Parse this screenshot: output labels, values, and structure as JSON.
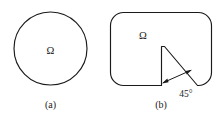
{
  "figure": {
    "background_color": "#ffffff",
    "stroke_color": "#1a1a1a",
    "panels": [
      {
        "id": "a",
        "caption": "(a)",
        "domain_label": "Ω",
        "shape": "circle",
        "description": "smooth circular domain",
        "geometry": {
          "center_x": 50.5,
          "center_y": 48.5,
          "radius": 36.5
        },
        "label_position": {
          "x": 50.5,
          "y": 52
        },
        "caption_position": {
          "x": 50.5,
          "y": 106
        }
      },
      {
        "id": "b",
        "caption": "(b)",
        "domain_label": "Ω",
        "shape": "rounded-square-with-wedge-notch",
        "description": "rounded square domain with re-entrant 45 degree wedge notch",
        "angle_label": "45°",
        "angle_value": 45,
        "angle_unit": "degrees",
        "geometry": {
          "left": 110.5,
          "right": 211.5,
          "top": 12.5,
          "bottom": 85.5,
          "corner_radius": 13,
          "notch_apex_x": 164.5,
          "notch_apex_y": 46.5,
          "notch_left_x": 161.5,
          "notch_base_y": 85.5,
          "notch_right_x": 197.5
        },
        "label_position": {
          "x": 143,
          "y": 37
        },
        "angle_label_position": {
          "x": 186,
          "y": 95
        },
        "caption_position": {
          "x": 161,
          "y": 106
        }
      }
    ]
  }
}
